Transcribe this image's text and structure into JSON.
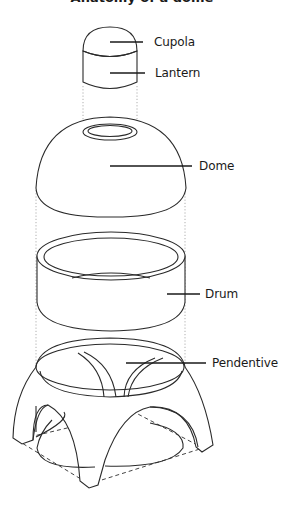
{
  "diagram": {
    "title_fragment": "Anatomy of a dome",
    "parts": [
      {
        "id": "cupola",
        "label": "Cupola"
      },
      {
        "id": "lantern",
        "label": "Lantern"
      },
      {
        "id": "dome",
        "label": "Dome"
      },
      {
        "id": "drum",
        "label": "Drum"
      },
      {
        "id": "pendentive",
        "label": "Pendentive"
      }
    ],
    "colors": {
      "background": "#ffffff",
      "stroke": "#2a2a2a",
      "guide": "#9a9a9a"
    }
  }
}
